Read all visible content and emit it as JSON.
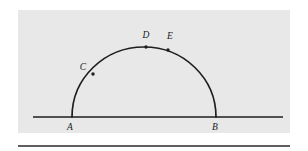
{
  "figure": {
    "kind": "geometry-diagram",
    "panel": {
      "background_color": "#e8e8e8",
      "x": 18,
      "y": 10,
      "width": 272,
      "height": 123
    },
    "page_background_color": "#ffffff",
    "ink_color": "#1f1f1f",
    "baseline": {
      "name": "horizontal-line",
      "x1": 33,
      "y1": 117,
      "x2": 283,
      "y2": 117,
      "stroke_width": 1.7
    },
    "arc": {
      "name": "semicircle",
      "center_x": 144,
      "center_y": 117,
      "radius_x": 72,
      "radius_y": 70,
      "start_x": 72,
      "start_y": 117,
      "end_x": 216,
      "end_y": 117,
      "apex_y": 47,
      "stroke_width": 1.7
    },
    "points": [
      {
        "id": "A",
        "label": "A",
        "x": 72,
        "y": 117,
        "marker": false,
        "label_x": 70,
        "label_y": 130,
        "anchor": "middle",
        "on": "baseline-left-endpoint"
      },
      {
        "id": "B",
        "label": "B",
        "x": 216,
        "y": 117,
        "marker": false,
        "label_x": 215,
        "label_y": 130,
        "anchor": "middle",
        "on": "baseline-right-endpoint"
      },
      {
        "id": "C",
        "label": "C",
        "x": 93,
        "y": 74,
        "marker": true,
        "label_x": 83,
        "label_y": 70,
        "anchor": "middle",
        "on": "arc"
      },
      {
        "id": "D",
        "label": "D",
        "x": 146,
        "y": 47,
        "marker": true,
        "label_x": 146,
        "label_y": 38,
        "anchor": "middle",
        "on": "arc"
      },
      {
        "id": "E",
        "label": "E",
        "x": 168,
        "y": 50,
        "marker": true,
        "label_x": 170,
        "label_y": 39,
        "anchor": "middle",
        "on": "arc"
      }
    ],
    "marker_radius": 1.7,
    "bottom_rule": {
      "name": "bottom-rule",
      "x1": 18,
      "y1": 146,
      "x2": 290,
      "y2": 146,
      "stroke_width": 1.4
    }
  }
}
